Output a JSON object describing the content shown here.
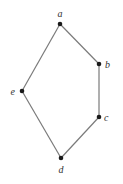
{
  "diagram": {
    "type": "hasse-diagram",
    "colors": {
      "edge": "#7a7a7a",
      "node": "#1a1a1a",
      "label": "#333333",
      "background": "#ffffff"
    },
    "nodes": [
      {
        "id": "a",
        "label": "a",
        "x": 60,
        "y": 24,
        "lx": 60,
        "ly": 17,
        "anchor": "middle"
      },
      {
        "id": "b",
        "label": "b",
        "x": 99,
        "y": 64,
        "lx": 105,
        "ly": 68,
        "anchor": "start"
      },
      {
        "id": "c",
        "label": "c",
        "x": 99,
        "y": 117,
        "lx": 104,
        "ly": 121,
        "anchor": "start"
      },
      {
        "id": "d",
        "label": "d",
        "x": 61,
        "y": 158,
        "lx": 61,
        "ly": 173,
        "anchor": "middle"
      },
      {
        "id": "e",
        "label": "e",
        "x": 22,
        "y": 91,
        "lx": 15,
        "ly": 95,
        "anchor": "end"
      }
    ],
    "edges": [
      {
        "from": "a",
        "to": "b"
      },
      {
        "from": "b",
        "to": "c"
      },
      {
        "from": "c",
        "to": "d"
      },
      {
        "from": "d",
        "to": "e"
      },
      {
        "from": "e",
        "to": "a"
      }
    ]
  }
}
